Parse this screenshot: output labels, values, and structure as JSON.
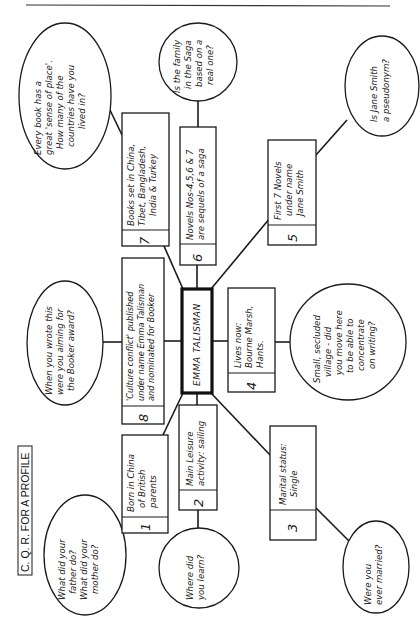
{
  "figure": {
    "title": "C. Q. R. FOR A PROFILE",
    "orientation": "rotated 90° counter-clockwise (text reads bottom-to-top)",
    "colors": {
      "ink": "#1a1a1a",
      "paper": "#ffffff"
    }
  },
  "center": {
    "name": "EMMA TALISMAN"
  },
  "facts": [
    {
      "number": "1",
      "lines": [
        "Born in China",
        "of British",
        "parents"
      ]
    },
    {
      "number": "2",
      "lines": [
        "Main Leisure",
        "activity: sailing"
      ]
    },
    {
      "number": "3",
      "lines": [
        "Marital status:",
        "Single"
      ]
    },
    {
      "number": "4",
      "lines": [
        "Lives now:",
        "Bourne Marsh,",
        "Hants."
      ]
    },
    {
      "number": "5",
      "lines": [
        "First 7 Novels",
        "under name",
        "Jane Smith"
      ]
    },
    {
      "number": "6",
      "lines": [
        "Novels Nos-4,5,6 & 7",
        "are sequels of a saga"
      ]
    },
    {
      "number": "7",
      "lines": [
        "Books set in China,",
        "Tibet, Bangladesh,",
        "India & Turkey"
      ]
    },
    {
      "number": "8",
      "lines": [
        "'Culture conflict' published",
        "under name Emma Talisman",
        "and nominated for Booker"
      ]
    }
  ],
  "questions": {
    "q1": [
      "What did your",
      "father do?",
      "What did your",
      "mother do?"
    ],
    "q2": [
      "Where did",
      "you learn?"
    ],
    "q3": [
      "Were you",
      "ever married?"
    ],
    "q4": [
      "Small, secluded",
      "village - did",
      "you move here",
      "to be able to",
      "concentrate",
      "on writing?"
    ],
    "q5": [
      "Is Jane Smith",
      "a pseudonym?"
    ],
    "q6": [
      "Is the family",
      "in the Saga",
      "based on a",
      "real one?"
    ],
    "q7": [
      "Every book has a",
      "great 'sense of place'.",
      "How many of the",
      "countries have you",
      "lived in?"
    ],
    "q8": [
      "When you wrote this",
      "were you aiming for",
      "the Booker award?"
    ]
  }
}
